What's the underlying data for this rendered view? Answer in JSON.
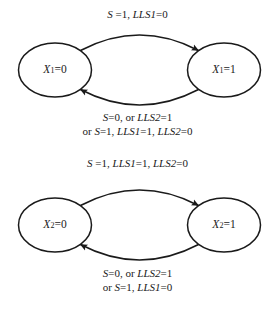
{
  "figure": {
    "type": "state-transition-diagram",
    "background": "#ffffff",
    "stroke_color": "#1a1a1a",
    "text_color": "#1a1a1a"
  },
  "diagrams": [
    {
      "id": "x1",
      "variable": "X",
      "subscript": "1",
      "states": [
        {
          "name": "state-x1-0",
          "var": "X",
          "sub": "1",
          "eq": "=0",
          "full_text": "X1=0",
          "cx": 55,
          "cy": 70
        },
        {
          "name": "state-x1-1",
          "var": "X",
          "sub": "1",
          "eq": "=1",
          "full_text": "X1=1",
          "cx": 224,
          "cy": 70
        }
      ],
      "transitions": [
        {
          "name": "transition-x1-0-to-1",
          "direction": "left-to-right",
          "label_lines": [
            [
              {
                "t": "S",
                "i": true
              },
              {
                "t": " =1, ",
                "i": false
              },
              {
                "t": "LLS1",
                "i": true
              },
              {
                "t": "=0",
                "i": false
              }
            ]
          ],
          "label_plain": "S =1, LLS1=0"
        },
        {
          "name": "transition-x1-1-to-0",
          "direction": "right-to-left",
          "label_lines": [
            [
              {
                "t": "S",
                "i": true
              },
              {
                "t": "=0, or ",
                "i": false
              },
              {
                "t": "LLS2",
                "i": true
              },
              {
                "t": "=1",
                "i": false
              }
            ],
            [
              {
                "t": "or ",
                "i": false
              },
              {
                "t": "S",
                "i": true
              },
              {
                "t": "=1, ",
                "i": false
              },
              {
                "t": "LLS1",
                "i": true
              },
              {
                "t": "=1, ",
                "i": false
              },
              {
                "t": "LLS2",
                "i": true
              },
              {
                "t": "=0",
                "i": false
              }
            ]
          ],
          "label_plain": "S=0, or LLS2=1 / or S=1, LLS1=1, LLS2=0"
        }
      ]
    },
    {
      "id": "x2",
      "variable": "X",
      "subscript": "2",
      "states": [
        {
          "name": "state-x2-0",
          "var": "X",
          "sub": "2",
          "eq": "=0",
          "full_text": "X2=0",
          "cx": 55,
          "cy": 225
        },
        {
          "name": "state-x2-1",
          "var": "X",
          "sub": "2",
          "eq": "=1",
          "full_text": "X2=1",
          "cx": 224,
          "cy": 225
        }
      ],
      "transitions": [
        {
          "name": "transition-x2-0-to-1",
          "direction": "left-to-right",
          "label_lines": [
            [
              {
                "t": "S",
                "i": true
              },
              {
                "t": " =1, ",
                "i": false
              },
              {
                "t": "LLS1",
                "i": true
              },
              {
                "t": "=1, ",
                "i": false
              },
              {
                "t": "LLS2",
                "i": true
              },
              {
                "t": "=0",
                "i": false
              }
            ]
          ],
          "label_plain": "S =1, LLS1=1, LLS2=0"
        },
        {
          "name": "transition-x2-1-to-0",
          "direction": "right-to-left",
          "label_lines": [
            [
              {
                "t": "S",
                "i": true
              },
              {
                "t": "=0, or ",
                "i": false
              },
              {
                "t": "LLS2",
                "i": true
              },
              {
                "t": "=1",
                "i": false
              }
            ],
            [
              {
                "t": "or ",
                "i": false
              },
              {
                "t": "S",
                "i": true
              },
              {
                "t": "=1, ",
                "i": false
              },
              {
                "t": "LLS1",
                "i": true
              },
              {
                "t": "=0",
                "i": false
              }
            ]
          ],
          "label_plain": "S=0, or LLS2=1 / or S=1, LLS1=0"
        }
      ]
    }
  ]
}
